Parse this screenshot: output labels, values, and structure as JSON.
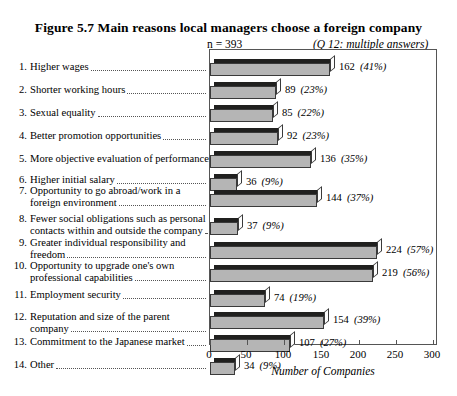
{
  "figure": {
    "title": "Figure 5.7   Main reasons local managers choose a foreign company",
    "n_label": "n = 393",
    "question_note": "(Q 12: multiple answers)"
  },
  "chart_data": {
    "type": "bar",
    "orientation": "horizontal",
    "title": "Main reasons local managers choose a foreign company",
    "xlabel": "Number of Companies",
    "ylabel": "",
    "xlim": [
      0,
      300
    ],
    "xticks": [
      "0",
      "50",
      "100",
      "150",
      "200",
      "250",
      "300"
    ],
    "grid": false,
    "legend": false,
    "n": 393,
    "categories": [
      "1. Higher wages",
      "2. Shorter working hours",
      "3. Sexual equality",
      "4. Better promotion opportunities",
      "5. More objective evaluation of performance",
      "6. Higher initial salary",
      "7. Opportunity to go abroad/work in a foreign environment",
      "8. Fewer social obligations such as personal contacts within and outside the company",
      "9. Greater individual responsibility and freedom",
      "10. Opportunity to upgrade one's own professional capabilities",
      "11. Employment security",
      "12. Reputation and size of the parent company",
      "13. Commitment to the Japanese market",
      "14. Other"
    ],
    "values": [
      162,
      89,
      85,
      92,
      136,
      36,
      144,
      37,
      224,
      219,
      74,
      154,
      107,
      34
    ],
    "percent_labels": [
      "(41%)",
      "(23%)",
      "(22%)",
      "(23%)",
      "(35%)",
      "(9%)",
      "(37%)",
      "(9%)",
      "(57%)",
      "(56%)",
      "(19%)",
      "(39%)",
      "(27%)",
      "(9%)"
    ]
  },
  "rows": [
    {
      "num": "1.",
      "line1": "Higher wages",
      "line2": "",
      "value": "162",
      "pct": "(41%)"
    },
    {
      "num": "2.",
      "line1": "Shorter working hours",
      "line2": "",
      "value": "89",
      "pct": "(23%)"
    },
    {
      "num": "3.",
      "line1": "Sexual equality",
      "line2": "",
      "value": "85",
      "pct": "(22%)"
    },
    {
      "num": "4.",
      "line1": "Better promotion opportunities",
      "line2": "",
      "value": "92",
      "pct": "(23%)"
    },
    {
      "num": "5.",
      "line1": "More objective evaluation of performance.",
      "line2": "",
      "value": "136",
      "pct": "(35%)"
    },
    {
      "num": "6.",
      "line1": "Higher initial salary",
      "line2": "",
      "value": "36",
      "pct": "(9%)"
    },
    {
      "num": "7.",
      "line1": "Opportunity to go abroad/work in a",
      "line2": "foreign environment",
      "value": "144",
      "pct": "(37%)"
    },
    {
      "num": "8.",
      "line1": "Fewer social obligations such as personal",
      "line2": "contacts within and outside the company",
      "value": "37",
      "pct": "(9%)"
    },
    {
      "num": "9.",
      "line1": "Greater individual responsibility and",
      "line2": "freedom",
      "value": "224",
      "pct": "(57%)"
    },
    {
      "num": "10.",
      "line1": "Opportunity to upgrade one's own",
      "line2": "professional capabilities",
      "value": "219",
      "pct": "(56%)"
    },
    {
      "num": "11.",
      "line1": "Employment security",
      "line2": "",
      "value": "74",
      "pct": "(19%)"
    },
    {
      "num": "12.",
      "line1": "Reputation and size of the parent",
      "line2": "company",
      "value": "154",
      "pct": "(39%)"
    },
    {
      "num": "13.",
      "line1": "Commitment to the Japanese market",
      "line2": "",
      "value": "107",
      "pct": "(27%)"
    },
    {
      "num": "14.",
      "line1": "Other",
      "line2": "",
      "value": "34",
      "pct": "(9%)"
    }
  ],
  "axis": {
    "title": "Number of Companies",
    "ticks": [
      "0",
      "50",
      "100",
      "150",
      "200",
      "250",
      "300"
    ]
  },
  "colors": {
    "bar_front": "#b5b5b5",
    "bar_top": "#20201f",
    "bar_cap": "#fdfdfd",
    "outline": "#3a3a3a",
    "frame": "#555555",
    "background": "#ffffff"
  }
}
